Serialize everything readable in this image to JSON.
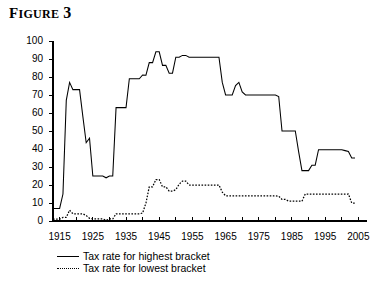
{
  "figure": {
    "title_prefix": "F",
    "title_small_caps": "IGURE",
    "title_number": "3"
  },
  "chart_data": {
    "type": "line",
    "xlabel": "",
    "ylabel": "",
    "xlim": [
      1913,
      2007
    ],
    "ylim": [
      0,
      100
    ],
    "yticks": [
      0,
      10,
      20,
      30,
      40,
      50,
      60,
      70,
      80,
      90,
      100
    ],
    "xticks": [
      1915,
      1920,
      1925,
      1930,
      1935,
      1940,
      1945,
      1950,
      1955,
      1960,
      1965,
      1970,
      1975,
      1980,
      1985,
      1990,
      1995,
      2000,
      2005
    ],
    "xtick_labels": [
      "1915",
      "",
      "1925",
      "",
      "1935",
      "",
      "1945",
      "",
      "1955",
      "",
      "1965",
      "",
      "1975",
      "",
      "1985",
      "",
      "1995",
      "",
      "2005"
    ],
    "xtick_labels_shown": [
      "1915",
      "1925",
      "1935",
      "1945",
      "1955",
      "1965",
      "1975",
      "1985",
      "1995",
      "2005"
    ],
    "grid": false,
    "legend_position": "below-axes-left",
    "series": [
      {
        "name": "Tax rate for highest bracket",
        "style": "solid",
        "color": "#000000",
        "x": [
          1913,
          1914,
          1915,
          1916,
          1917,
          1918,
          1919,
          1920,
          1921,
          1922,
          1923,
          1924,
          1925,
          1926,
          1927,
          1928,
          1929,
          1930,
          1931,
          1932,
          1933,
          1934,
          1935,
          1936,
          1937,
          1938,
          1939,
          1940,
          1941,
          1942,
          1943,
          1944,
          1945,
          1946,
          1947,
          1948,
          1949,
          1950,
          1951,
          1952,
          1953,
          1954,
          1955,
          1956,
          1957,
          1958,
          1959,
          1960,
          1961,
          1962,
          1963,
          1964,
          1965,
          1966,
          1967,
          1968,
          1969,
          1970,
          1971,
          1972,
          1973,
          1974,
          1975,
          1976,
          1977,
          1978,
          1979,
          1980,
          1981,
          1982,
          1983,
          1984,
          1985,
          1986,
          1987,
          1988,
          1989,
          1990,
          1991,
          1992,
          1993,
          1994,
          1995,
          1996,
          1997,
          1998,
          1999,
          2000,
          2001,
          2002,
          2003,
          2004
        ],
        "values": [
          7,
          7,
          7,
          15,
          67,
          77,
          73,
          73,
          73,
          58,
          43.5,
          46,
          25,
          25,
          25,
          25,
          24,
          25,
          25,
          63,
          63,
          63,
          63,
          79,
          79,
          79,
          79,
          81.1,
          81,
          88,
          88,
          94,
          94,
          86.45,
          86.45,
          82.13,
          82.13,
          91,
          91,
          92,
          92,
          91,
          91,
          91,
          91,
          91,
          91,
          91,
          91,
          91,
          91,
          77,
          70,
          70,
          70,
          75.25,
          77,
          71.75,
          70,
          70,
          70,
          70,
          70,
          70,
          70,
          70,
          70,
          70,
          69.125,
          50,
          50,
          50,
          50,
          50,
          38.5,
          28,
          28,
          28,
          31,
          31,
          39.6,
          39.6,
          39.6,
          39.6,
          39.6,
          39.6,
          39.6,
          39.6,
          39.1,
          38.6,
          35,
          35
        ]
      },
      {
        "name": "Tax rate for lowest bracket",
        "style": "dotted",
        "color": "#000000",
        "x": [
          1913,
          1914,
          1915,
          1916,
          1917,
          1918,
          1919,
          1920,
          1921,
          1922,
          1923,
          1924,
          1925,
          1926,
          1927,
          1928,
          1929,
          1930,
          1931,
          1932,
          1933,
          1934,
          1935,
          1936,
          1937,
          1938,
          1939,
          1940,
          1941,
          1942,
          1943,
          1944,
          1945,
          1946,
          1947,
          1948,
          1949,
          1950,
          1951,
          1952,
          1953,
          1954,
          1955,
          1956,
          1957,
          1958,
          1959,
          1960,
          1961,
          1962,
          1963,
          1964,
          1965,
          1966,
          1967,
          1968,
          1969,
          1970,
          1971,
          1972,
          1973,
          1974,
          1975,
          1976,
          1977,
          1978,
          1979,
          1980,
          1981,
          1982,
          1983,
          1984,
          1985,
          1986,
          1987,
          1988,
          1989,
          1990,
          1991,
          1992,
          1993,
          1994,
          1995,
          1996,
          1997,
          1998,
          1999,
          2000,
          2001,
          2002,
          2003,
          2004
        ],
        "values": [
          1,
          1,
          1,
          2,
          2,
          6,
          4,
          4,
          4,
          4,
          3,
          1.5,
          1.125,
          1.125,
          1.125,
          1.125,
          0.375,
          1.125,
          1.125,
          4,
          4,
          4,
          4,
          4,
          4,
          4,
          4,
          4.4,
          10,
          19,
          19,
          23,
          23,
          19,
          19,
          16.6,
          16.6,
          17.4,
          20.4,
          22.2,
          22.2,
          20,
          20,
          20,
          20,
          20,
          20,
          20,
          20,
          20,
          20,
          16,
          14,
          14,
          14,
          14,
          14,
          14,
          14,
          14,
          14,
          14,
          14,
          14,
          14,
          14,
          14,
          14,
          13.825,
          12,
          12,
          11,
          11,
          11,
          11,
          11,
          15,
          15,
          15,
          15,
          15,
          15,
          15,
          15,
          15,
          15,
          15,
          15,
          15,
          15,
          10,
          10
        ]
      }
    ],
    "annotations": []
  },
  "legend": {
    "items": [
      {
        "label": "Tax rate for highest bracket",
        "style": "solid"
      },
      {
        "label": "Tax rate for lowest bracket",
        "style": "dotted"
      }
    ]
  },
  "caption_fragment": ""
}
